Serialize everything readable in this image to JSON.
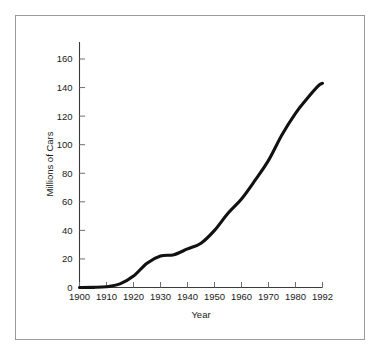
{
  "figure": {
    "background_color": "#ffffff",
    "frame_color": "#9a9a9a",
    "line_color": "#111111"
  },
  "chart_data": {
    "type": "line",
    "title": "",
    "subtitle": "",
    "xlabel": "Year",
    "ylabel": "Millions of Cars",
    "xlim": [
      1900,
      1992
    ],
    "ylim": [
      0,
      160
    ],
    "grid": false,
    "legend": null,
    "x_tick_labels": [
      "1900",
      "1910",
      "1920",
      "1930",
      "1940",
      "1950",
      "1960",
      "1970",
      "1980",
      "1992"
    ],
    "x_tick_values": [
      1900,
      1910,
      1920,
      1930,
      1940,
      1950,
      1960,
      1970,
      1980,
      1992
    ],
    "y_tick_labels": [
      "0",
      "20",
      "40",
      "60",
      "80",
      "100",
      "120",
      "140",
      "160"
    ],
    "y_tick_values": [
      0,
      20,
      40,
      60,
      80,
      100,
      120,
      140,
      160
    ],
    "series": [
      {
        "name": "Millions of Cars",
        "x": [
          1900,
          1905,
          1910,
          1915,
          1920,
          1925,
          1930,
          1935,
          1940,
          1945,
          1950,
          1955,
          1960,
          1965,
          1970,
          1975,
          1980,
          1985,
          1990,
          1992
        ],
        "values": [
          0,
          0.1,
          0.5,
          2.5,
          8,
          17,
          22,
          23,
          27,
          31,
          40,
          52,
          62,
          75,
          89,
          107,
          122,
          132,
          141,
          143
        ]
      }
    ],
    "annotations": []
  }
}
